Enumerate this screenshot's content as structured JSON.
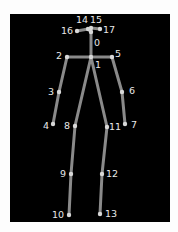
{
  "diagram": {
    "type": "pose-skeleton",
    "background": "#000000",
    "bone_color": "#8a8a8a",
    "joint_color": "#d8d8d8",
    "label_color": "#e8e8e8",
    "joints": [
      {
        "id": "0",
        "x": 91,
        "y": 32,
        "lx": 94,
        "ly": 38
      },
      {
        "id": "1",
        "x": 91,
        "y": 57,
        "lx": 95,
        "ly": 60
      },
      {
        "id": "2",
        "x": 67,
        "y": 57,
        "lx": 56,
        "ly": 51
      },
      {
        "id": "3",
        "x": 59,
        "y": 92,
        "lx": 48,
        "ly": 87
      },
      {
        "id": "4",
        "x": 53,
        "y": 124,
        "lx": 43,
        "ly": 121
      },
      {
        "id": "5",
        "x": 112,
        "y": 57,
        "lx": 115,
        "ly": 49
      },
      {
        "id": "6",
        "x": 122,
        "y": 92,
        "lx": 129,
        "ly": 86
      },
      {
        "id": "7",
        "x": 125,
        "y": 124,
        "lx": 131,
        "ly": 120
      },
      {
        "id": "8",
        "x": 75,
        "y": 126,
        "lx": 64,
        "ly": 121
      },
      {
        "id": "9",
        "x": 71,
        "y": 174,
        "lx": 60,
        "ly": 169
      },
      {
        "id": "10",
        "x": 69,
        "y": 215,
        "lx": 52,
        "ly": 210
      },
      {
        "id": "11",
        "x": 107,
        "y": 127,
        "lx": 109,
        "ly": 122
      },
      {
        "id": "12",
        "x": 102,
        "y": 174,
        "lx": 106,
        "ly": 169
      },
      {
        "id": "13",
        "x": 100,
        "y": 214,
        "lx": 105,
        "ly": 209
      },
      {
        "id": "14",
        "x": 88,
        "y": 29,
        "lx": 76,
        "ly": 15
      },
      {
        "id": "15",
        "x": 91,
        "y": 28,
        "lx": 90,
        "ly": 15
      },
      {
        "id": "16",
        "x": 77,
        "y": 31,
        "lx": 61,
        "ly": 26
      },
      {
        "id": "17",
        "x": 100,
        "y": 29,
        "lx": 103,
        "ly": 25
      }
    ],
    "bones": [
      [
        "0",
        "1"
      ],
      [
        "1",
        "2"
      ],
      [
        "2",
        "3"
      ],
      [
        "3",
        "4"
      ],
      [
        "1",
        "5"
      ],
      [
        "5",
        "6"
      ],
      [
        "6",
        "7"
      ],
      [
        "1",
        "8"
      ],
      [
        "8",
        "9"
      ],
      [
        "9",
        "10"
      ],
      [
        "1",
        "11"
      ],
      [
        "11",
        "12"
      ],
      [
        "12",
        "13"
      ],
      [
        "0",
        "14"
      ],
      [
        "14",
        "16"
      ],
      [
        "0",
        "15"
      ],
      [
        "15",
        "17"
      ]
    ]
  }
}
